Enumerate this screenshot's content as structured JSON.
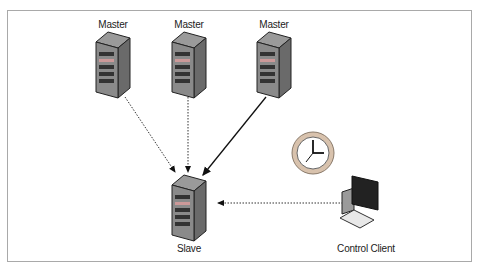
{
  "diagram": {
    "type": "replication-topology",
    "nodes": [
      {
        "id": "master1",
        "label": "Master",
        "kind": "server"
      },
      {
        "id": "master2",
        "label": "Master",
        "kind": "server"
      },
      {
        "id": "master3",
        "label": "Master",
        "kind": "server"
      },
      {
        "id": "slave",
        "label": "Slave",
        "kind": "server"
      },
      {
        "id": "client",
        "label": "Control Client",
        "kind": "workstation"
      },
      {
        "id": "clock",
        "label": "",
        "kind": "clock-icon"
      }
    ],
    "edges": [
      {
        "from": "master1",
        "to": "slave",
        "style": "dotted"
      },
      {
        "from": "master2",
        "to": "slave",
        "style": "dotted"
      },
      {
        "from": "master3",
        "to": "slave",
        "style": "solid"
      },
      {
        "from": "client",
        "to": "slave",
        "style": "dotted"
      }
    ],
    "colors": {
      "server_body": "#7d7d7d",
      "server_dark": "#3a3a3a",
      "border": "#a9a9a9",
      "clock_rim": "#c9a98a"
    }
  }
}
